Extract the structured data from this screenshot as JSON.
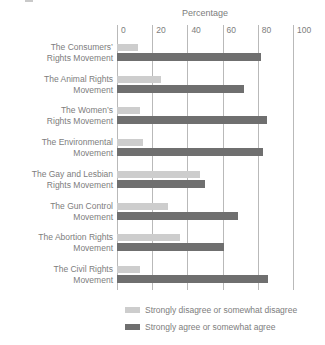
{
  "chart_data": {
    "type": "bar",
    "orientation": "horizontal",
    "title": "Percentage",
    "xlabel": "Percentage",
    "xticks": [
      0,
      20,
      40,
      60,
      80,
      100
    ],
    "xlim": [
      0,
      100
    ],
    "grid": "vertical",
    "legend_position": "bottom",
    "categories": [
      [
        "The Consumers’",
        "Rights Movement"
      ],
      [
        "The Animal Rights",
        "Movement"
      ],
      [
        "The Women’s",
        "Rights Movement"
      ],
      [
        "The Environmental",
        "Movement"
      ],
      [
        "The Gay and Lesbian",
        "Rights Movement"
      ],
      [
        "The Gun Control",
        "Movement"
      ],
      [
        "The Abortion Rights",
        "Movement"
      ],
      [
        "The Civil Rights",
        "Movement"
      ]
    ],
    "series": [
      {
        "name": "Strongly disagree or somewhat disagree",
        "color": "#cdcdcd",
        "values": [
          12,
          25,
          13,
          15,
          47,
          29,
          36,
          13
        ]
      },
      {
        "name": "Strongly agree or somewhat agree",
        "color": "#6f6f6f",
        "values": [
          82,
          72,
          85,
          83,
          50,
          69,
          61,
          86
        ]
      }
    ]
  },
  "colors": {
    "background": "#ffffff",
    "gridline": "#b9b9b9",
    "text": "#7d7d7d"
  }
}
